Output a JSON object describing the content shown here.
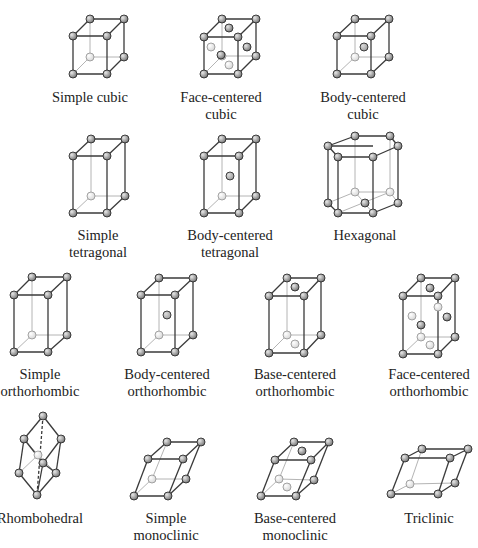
{
  "colors": {
    "edge_front": "#3a3a3a",
    "edge_hidden": "#b4b4b4",
    "atom_front": "#7a7a7a",
    "atom_hidden": "#d8d8d8",
    "atom_center": "#a0a0a0"
  },
  "lattices": [
    {
      "id": "simple-cubic",
      "label_lines": [
        "Simple cubic"
      ],
      "label_pos": [
        90,
        89
      ],
      "box": {
        "tb": [
          [
            90,
            19
          ],
          [
            124,
            19
          ]
        ],
        "tf": [
          [
            73,
            36
          ],
          [
            107,
            36
          ]
        ],
        "bb": [
          [
            90,
            57
          ],
          [
            124,
            57
          ]
        ],
        "bf": [
          [
            73,
            74
          ],
          [
            107,
            74
          ]
        ]
      },
      "extra_atoms": []
    },
    {
      "id": "face-centered-cubic",
      "label_lines": [
        "Face-centered",
        "cubic"
      ],
      "label_pos": [
        221,
        89
      ],
      "box": {
        "tb": [
          [
            222,
            19
          ],
          [
            256,
            19
          ]
        ],
        "tf": [
          [
            204,
            37
          ],
          [
            238,
            37
          ]
        ],
        "bb": [
          [
            222,
            56
          ],
          [
            256,
            56
          ]
        ],
        "bf": [
          [
            204,
            74
          ],
          [
            238,
            74
          ]
        ]
      },
      "extra_atoms": [
        {
          "x": 229,
          "y": 28,
          "kind": "front"
        },
        {
          "x": 211,
          "y": 47,
          "kind": "hidden"
        },
        {
          "x": 247,
          "y": 47,
          "kind": "front"
        },
        {
          "x": 221,
          "y": 55,
          "kind": "front"
        },
        {
          "x": 229,
          "y": 65,
          "kind": "hidden"
        }
      ]
    },
    {
      "id": "body-centered-cubic",
      "label_lines": [
        "Body-centered",
        "cubic"
      ],
      "label_pos": [
        363,
        89
      ],
      "box": {
        "tb": [
          [
            355,
            19
          ],
          [
            389,
            19
          ]
        ],
        "tf": [
          [
            337,
            36
          ],
          [
            371,
            36
          ]
        ],
        "bb": [
          [
            355,
            57
          ],
          [
            389,
            57
          ]
        ],
        "bf": [
          [
            337,
            74
          ],
          [
            371,
            74
          ]
        ]
      },
      "extra_atoms": [
        {
          "x": 364,
          "y": 47,
          "kind": "center"
        }
      ]
    },
    {
      "id": "simple-tetragonal",
      "label_lines": [
        "Simple",
        "tetragonal"
      ],
      "label_pos": [
        98,
        227
      ],
      "box": {
        "tb": [
          [
            91,
            139
          ],
          [
            125,
            139
          ]
        ],
        "tf": [
          [
            73,
            156
          ],
          [
            107,
            156
          ]
        ],
        "bb": [
          [
            91,
            196
          ],
          [
            125,
            196
          ]
        ],
        "bf": [
          [
            73,
            213
          ],
          [
            107,
            213
          ]
        ]
      },
      "extra_atoms": []
    },
    {
      "id": "body-centered-tetragonal",
      "label_lines": [
        "Body-centered",
        "tetragonal"
      ],
      "label_pos": [
        230,
        227
      ],
      "box": {
        "tb": [
          [
            222,
            139
          ],
          [
            256,
            139
          ]
        ],
        "tf": [
          [
            204,
            156
          ],
          [
            239,
            156
          ]
        ],
        "bb": [
          [
            222,
            196
          ],
          [
            256,
            196
          ]
        ],
        "bf": [
          [
            204,
            213
          ],
          [
            239,
            213
          ]
        ]
      },
      "extra_atoms": [
        {
          "x": 230,
          "y": 176,
          "kind": "center"
        }
      ]
    },
    {
      "id": "hexagonal",
      "label_lines": [
        "Hexagonal"
      ],
      "label_pos": [
        365,
        227
      ],
      "hexagon": {
        "top": [
          [
            328,
            146
          ],
          [
            355,
            136
          ],
          [
            390,
            136
          ],
          [
            398,
            146
          ],
          [
            373,
            157
          ],
          [
            338,
            157
          ]
        ],
        "bottom": [
          [
            328,
            203
          ],
          [
            355,
            192
          ],
          [
            390,
            192
          ],
          [
            398,
            203
          ],
          [
            373,
            213
          ],
          [
            338,
            213
          ]
        ],
        "top_center": [
          365,
          146
        ],
        "bottom_center": [
          365,
          203
        ]
      },
      "extra_atoms": []
    },
    {
      "id": "simple-orthorhombic",
      "label_lines": [
        "Simple",
        "orthorhombic"
      ],
      "label_pos": [
        40,
        366
      ],
      "box": {
        "tb": [
          [
            32,
            277
          ],
          [
            67,
            277
          ]
        ],
        "tf": [
          [
            14,
            295
          ],
          [
            48,
            295
          ]
        ],
        "bb": [
          [
            32,
            335
          ],
          [
            67,
            335
          ]
        ],
        "bf": [
          [
            14,
            352
          ],
          [
            48,
            352
          ]
        ]
      },
      "extra_atoms": []
    },
    {
      "id": "body-centered-orthorhombic",
      "label_lines": [
        "Body-centered",
        "orthorhombic"
      ],
      "label_pos": [
        167,
        366
      ],
      "box": {
        "tb": [
          [
            159,
            278
          ],
          [
            193,
            278
          ]
        ],
        "tf": [
          [
            141,
            295
          ],
          [
            175,
            295
          ]
        ],
        "bb": [
          [
            159,
            335
          ],
          [
            193,
            335
          ]
        ],
        "bf": [
          [
            141,
            352
          ],
          [
            175,
            352
          ]
        ]
      },
      "extra_atoms": [
        {
          "x": 167,
          "y": 315,
          "kind": "center"
        }
      ]
    },
    {
      "id": "base-centered-orthorhombic",
      "label_lines": [
        "Base-centered",
        "orthorhombic"
      ],
      "label_pos": [
        295,
        366
      ],
      "box": {
        "tb": [
          [
            287,
            278
          ],
          [
            321,
            278
          ]
        ],
        "tf": [
          [
            269,
            296
          ],
          [
            304,
            296
          ]
        ],
        "bb": [
          [
            287,
            335
          ],
          [
            321,
            335
          ]
        ],
        "bf": [
          [
            269,
            353
          ],
          [
            304,
            353
          ]
        ]
      },
      "extra_atoms": [
        {
          "x": 295,
          "y": 287,
          "kind": "front"
        },
        {
          "x": 295,
          "y": 344,
          "kind": "hidden"
        }
      ]
    },
    {
      "id": "face-centered-orthorhombic",
      "label_lines": [
        "Face-centered",
        "orthorhombic"
      ],
      "label_pos": [
        429,
        366
      ],
      "box": {
        "tb": [
          [
            421,
            278
          ],
          [
            455,
            278
          ]
        ],
        "tf": [
          [
            403,
            296
          ],
          [
            438,
            296
          ]
        ],
        "bb": [
          [
            421,
            337
          ],
          [
            455,
            337
          ]
        ],
        "bf": [
          [
            403,
            354
          ],
          [
            438,
            354
          ]
        ]
      },
      "extra_atoms": [
        {
          "x": 430,
          "y": 288,
          "kind": "front"
        },
        {
          "x": 412,
          "y": 316,
          "kind": "hidden"
        },
        {
          "x": 438,
          "y": 307,
          "kind": "hidden"
        },
        {
          "x": 447,
          "y": 317,
          "kind": "front"
        },
        {
          "x": 421,
          "y": 325,
          "kind": "front"
        },
        {
          "x": 430,
          "y": 345,
          "kind": "hidden"
        }
      ]
    },
    {
      "id": "rhombohedral",
      "label_lines": [
        "Rhombohedral"
      ],
      "label_pos": [
        40,
        510
      ],
      "rhombo": {
        "top": [
          43,
          416
        ],
        "lu": [
          24,
          439
        ],
        "ru": [
          61,
          439
        ],
        "hc": [
          38,
          455
        ],
        "mf": [
          43,
          463
        ],
        "ll": [
          19,
          473
        ],
        "rl": [
          56,
          473
        ],
        "bottom": [
          37,
          495
        ]
      },
      "extra_atoms": []
    },
    {
      "id": "simple-monoclinic",
      "label_lines": [
        "Simple",
        "monoclinic"
      ],
      "label_pos": [
        166,
        510
      ],
      "box": {
        "tb": [
          [
            167,
            442
          ],
          [
            201,
            442
          ]
        ],
        "tf": [
          [
            148,
            459
          ],
          [
            183,
            459
          ]
        ],
        "bb": [
          [
            152,
            479
          ],
          [
            186,
            479
          ]
        ],
        "bf": [
          [
            134,
            496
          ],
          [
            168,
            496
          ]
        ]
      },
      "extra_atoms": []
    },
    {
      "id": "base-centered-monoclinic",
      "label_lines": [
        "Base-centered",
        "monoclinic"
      ],
      "label_pos": [
        295,
        510
      ],
      "box": {
        "tb": [
          [
            294,
            442
          ],
          [
            329,
            442
          ]
        ],
        "tf": [
          [
            275,
            460
          ],
          [
            311,
            460
          ]
        ],
        "bb": [
          [
            279,
            479
          ],
          [
            314,
            480
          ]
        ],
        "bf": [
          [
            261,
            496
          ],
          [
            296,
            496
          ]
        ]
      },
      "extra_atoms": [
        {
          "x": 302,
          "y": 451,
          "kind": "front"
        },
        {
          "x": 287,
          "y": 487,
          "kind": "hidden"
        }
      ]
    },
    {
      "id": "triclinic",
      "label_lines": [
        "Triclinic"
      ],
      "label_pos": [
        429,
        510
      ],
      "box": {
        "tb": [
          [
            422,
            449
          ],
          [
            468,
            449
          ]
        ],
        "tf": [
          [
            405,
            458
          ],
          [
            450,
            458
          ]
        ],
        "bb": [
          [
            410,
            484
          ],
          [
            455,
            483
          ]
        ],
        "bf": [
          [
            391,
            494
          ],
          [
            438,
            494
          ]
        ]
      },
      "extra_atoms": []
    }
  ]
}
